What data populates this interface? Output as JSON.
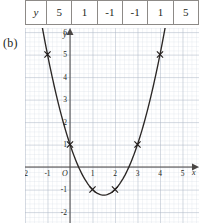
{
  "table": {
    "row_label": "y",
    "values": [
      "5",
      "1",
      "-1",
      "-1",
      "1",
      "5"
    ]
  },
  "part_label": "(b)",
  "graph": {
    "axis_labels": {
      "x": "x",
      "y": "y",
      "origin": "O"
    },
    "x_ticks": [
      "-2",
      "-1",
      "1",
      "2",
      "3",
      "4",
      "5"
    ],
    "y_ticks": [
      "6",
      "5",
      "4",
      "3",
      "2",
      "1",
      "-1",
      "-2"
    ],
    "colors": {
      "curve": "#2b2725",
      "axis": "#4a4644",
      "grid_minor": "#cfd6e0",
      "grid_major": "#aab4c2",
      "marker": "#221e1c",
      "table_border": "#8d8a87",
      "text": "#231f20"
    }
  },
  "chart_data": {
    "type": "line",
    "title": "",
    "xlabel": "x",
    "ylabel": "y",
    "xlim": [
      -2.5,
      5.5
    ],
    "ylim": [
      -2.6,
      6.8
    ],
    "grid": true,
    "legend": "none",
    "x": [
      -1,
      0,
      1,
      2,
      3,
      4
    ],
    "values": [
      5,
      1,
      -1,
      -1,
      1,
      5
    ],
    "series": [
      {
        "name": "y = x^2 - 3x + 1",
        "x": [
          -1,
          0,
          1,
          2,
          3,
          4
        ],
        "values": [
          5,
          1,
          -1,
          -1,
          1,
          5
        ]
      }
    ],
    "marked_points": [
      {
        "x": -1,
        "y": 5
      },
      {
        "x": 0,
        "y": 1
      },
      {
        "x": 1,
        "y": -1
      },
      {
        "x": 2,
        "y": -1
      },
      {
        "x": 3,
        "y": 1
      },
      {
        "x": 4,
        "y": 5
      }
    ],
    "vertex": {
      "x": 1.5,
      "y": -1.25
    },
    "xticks": [
      -2,
      -1,
      1,
      2,
      3,
      4,
      5
    ],
    "yticks": [
      6,
      5,
      4,
      3,
      2,
      1,
      -1,
      -2
    ],
    "xtick_labels": [
      "-2",
      "-1",
      "1",
      "2",
      "3",
      "4",
      "5"
    ],
    "ytick_labels": [
      "6",
      "5",
      "4",
      "3",
      "2",
      "1",
      "-1",
      "-2"
    ]
  }
}
